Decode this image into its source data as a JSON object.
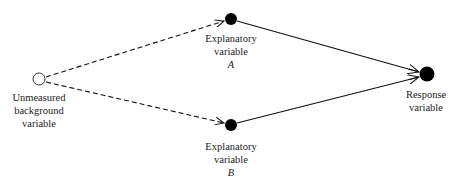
{
  "diagram": {
    "type": "causal-path-diagram",
    "nodes": [
      {
        "id": "unmeasured",
        "label_lines": [
          "Unmeasured",
          "background",
          "variable"
        ],
        "style": "open-circle",
        "x": 39,
        "y": 79
      },
      {
        "id": "A",
        "label_lines": [
          "Explanatory",
          "variable",
          "A"
        ],
        "style": "filled-circle",
        "x": 231,
        "y": 19
      },
      {
        "id": "B",
        "label_lines": [
          "Explanatory",
          "variable",
          "B"
        ],
        "style": "filled-circle",
        "x": 231,
        "y": 125
      },
      {
        "id": "response",
        "label_lines": [
          "Response",
          "variable"
        ],
        "style": "filled-circle-large",
        "x": 427,
        "y": 74
      }
    ],
    "edges": [
      {
        "from": "unmeasured",
        "to": "A",
        "style": "dashed",
        "arrow": "end"
      },
      {
        "from": "unmeasured",
        "to": "B",
        "style": "dashed",
        "arrow": "end"
      },
      {
        "from": "A",
        "to": "response",
        "style": "solid",
        "arrow": "end"
      },
      {
        "from": "B",
        "to": "response",
        "style": "solid",
        "arrow": "end"
      }
    ],
    "colors": {
      "line": "#111111",
      "node_fill": "#000000",
      "text": "#222222"
    }
  },
  "labels": {
    "unmeasured": {
      "l1": "Unmeasured",
      "l2": "background",
      "l3": "variable"
    },
    "A": {
      "l1": "Explanatory",
      "l2": "variable",
      "l3": "A"
    },
    "B": {
      "l1": "Explanatory",
      "l2": "variable",
      "l3": "B"
    },
    "response": {
      "l1": "Response",
      "l2": "variable"
    }
  }
}
